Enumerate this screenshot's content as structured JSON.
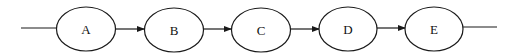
{
  "diagram": {
    "type": "linear-flow",
    "stroke_color": "#1a1a1a",
    "background": "#ffffff",
    "nodes": [
      {
        "id": "A",
        "label": "A",
        "cx": 86,
        "cy": 29
      },
      {
        "id": "B",
        "label": "B",
        "cx": 174,
        "cy": 30
      },
      {
        "id": "C",
        "label": "C",
        "cx": 261,
        "cy": 30
      },
      {
        "id": "D",
        "label": "D",
        "cx": 348,
        "cy": 29
      },
      {
        "id": "E",
        "label": "E",
        "cx": 434,
        "cy": 29
      }
    ],
    "edges": [
      {
        "from": "input",
        "to": "A",
        "arrow": false
      },
      {
        "from": "A",
        "to": "B",
        "arrow": true
      },
      {
        "from": "B",
        "to": "C",
        "arrow": true
      },
      {
        "from": "C",
        "to": "D",
        "arrow": true
      },
      {
        "from": "D",
        "to": "E",
        "arrow": true
      },
      {
        "from": "E",
        "to": "output",
        "arrow": false
      }
    ]
  }
}
